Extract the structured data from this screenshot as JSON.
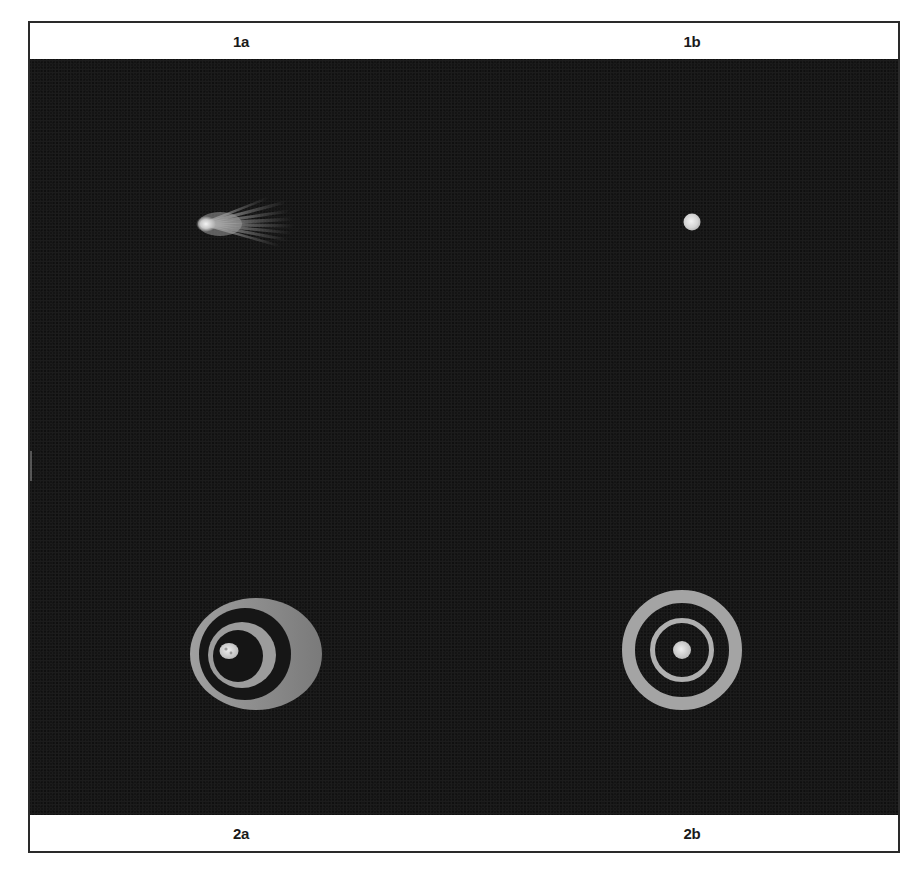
{
  "figure": {
    "panels": [
      {
        "id": "1a",
        "label": "1a",
        "subject": "comet-like object with fan of streamers",
        "position": "top-left"
      },
      {
        "id": "1b",
        "label": "1b",
        "subject": "small bright disk",
        "position": "top-right"
      },
      {
        "id": "2a",
        "label": "2a",
        "subject": "eccentric concentric rings around nucleus",
        "position": "bottom-left"
      },
      {
        "id": "2b",
        "label": "2b",
        "subject": "concentric rings centered on nucleus",
        "position": "bottom-right"
      }
    ],
    "labels": {
      "top_left": "1a",
      "top_right": "1b",
      "bottom_left": "2a",
      "bottom_right": "2b"
    },
    "colors": {
      "background": "#141414",
      "frame_border": "#2a2a2a",
      "label_text": "#1a1a1a",
      "ring_gray": "#8c8c8c",
      "ring_light": "#a8a8a8",
      "nucleus": "#d8d8d8"
    }
  }
}
